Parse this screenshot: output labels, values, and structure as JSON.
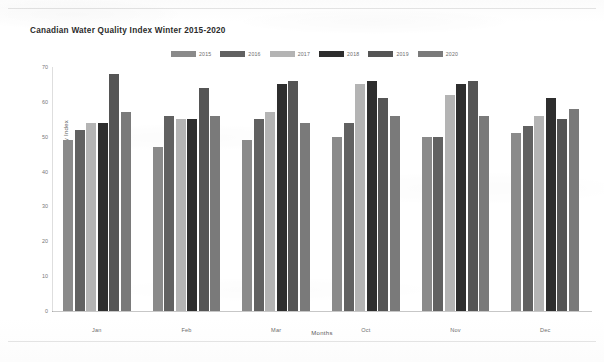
{
  "chart_data": {
    "type": "bar",
    "title": "Canadian Water Quality Index Winter 2015-2020",
    "xlabel": "Months",
    "ylabel": "Canadian Water Quality Index",
    "ylim": [
      0,
      70
    ],
    "yticks": [
      0,
      10,
      20,
      30,
      40,
      50,
      60,
      70
    ],
    "grid": false,
    "legend_position": "top-center",
    "categories": [
      "Jan",
      "Feb",
      "Mar",
      "Oct",
      "Nov",
      "Dec"
    ],
    "series": [
      {
        "name": "2015",
        "color": "#8a8a8a",
        "values": [
          49,
          47,
          49,
          50,
          50,
          51
        ]
      },
      {
        "name": "2016",
        "color": "#616161",
        "values": [
          52,
          56,
          55,
          54,
          50,
          53
        ]
      },
      {
        "name": "2017",
        "color": "#b4b4b4",
        "values": [
          54,
          55,
          57,
          65,
          62,
          56
        ]
      },
      {
        "name": "2018",
        "color": "#2e2e2e",
        "values": [
          54,
          55,
          65,
          66,
          65,
          61
        ]
      },
      {
        "name": "2019",
        "color": "#555555",
        "values": [
          68,
          64,
          66,
          61,
          66,
          55
        ]
      },
      {
        "name": "2020",
        "color": "#7a7a7a",
        "values": [
          57,
          56,
          54,
          56,
          56,
          58
        ]
      }
    ]
  }
}
